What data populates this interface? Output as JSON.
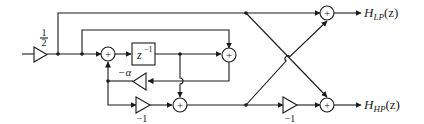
{
  "diagram": {
    "type": "signal-flow block diagram",
    "input_gain": {
      "numerator": "1",
      "denominator": "2"
    },
    "delay_block": {
      "label_base": "z",
      "label_exp": "−1"
    },
    "feedback_gain": {
      "label": "−α"
    },
    "inner_gain": {
      "label": "−1"
    },
    "output_gain": {
      "label": "−1"
    },
    "adder_symbol": "+",
    "outputs": {
      "lowpass": {
        "base": "H",
        "sub": "LP",
        "arg": "(z)"
      },
      "highpass": {
        "base": "H",
        "sub": "HP",
        "arg": "(z)"
      }
    }
  }
}
